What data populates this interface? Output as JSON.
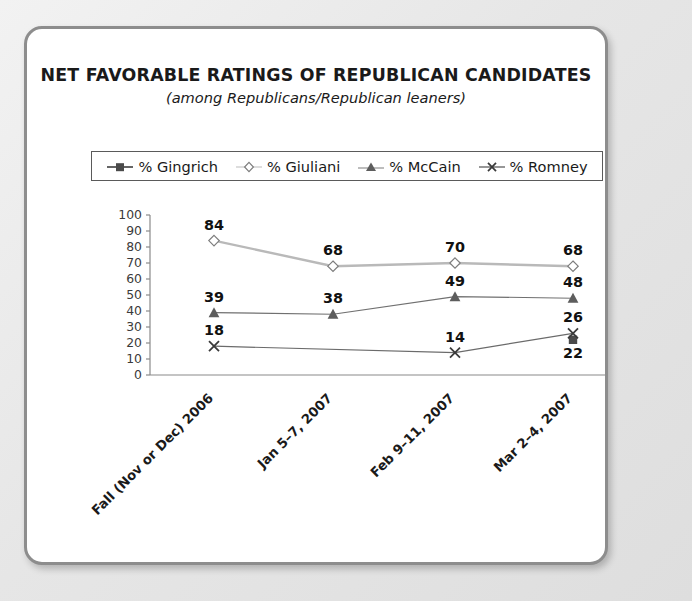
{
  "card": {
    "title": "NET FAVORABLE RATINGS OF REPUBLICAN CANDIDATES",
    "subtitle": "(among Republicans/Republican leaners)"
  },
  "chart_data": {
    "type": "line",
    "title": "NET FAVORABLE RATINGS OF REPUBLICAN CANDIDATES",
    "subtitle": "(among Republicans/Republican leaners)",
    "xlabel": "",
    "ylabel": "",
    "ylim": [
      0,
      100
    ],
    "yticks": [
      0,
      10,
      20,
      30,
      40,
      50,
      60,
      70,
      80,
      90,
      100
    ],
    "grid": false,
    "legend_position": "top",
    "categories": [
      "Fall (Nov or Dec) 2006",
      "Jan 5–7, 2007",
      "Feb 9–11, 2007",
      "Mar 2–4, 2007"
    ],
    "series": [
      {
        "name": "% Gingrich",
        "marker": "square",
        "color": "#4a4a4a",
        "values": [
          null,
          null,
          null,
          22
        ],
        "labels": [
          "",
          "",
          "",
          "22"
        ]
      },
      {
        "name": "% Giuliani",
        "marker": "diamond",
        "color": "#b9b9b9",
        "values": [
          84,
          68,
          70,
          68
        ],
        "labels": [
          "84",
          "68",
          "70",
          "68"
        ]
      },
      {
        "name": "% McCain",
        "marker": "triangle",
        "color": "#707070",
        "values": [
          39,
          38,
          49,
          48
        ],
        "labels": [
          "39",
          "38",
          "49",
          "48"
        ]
      },
      {
        "name": "% Romney",
        "marker": "x",
        "color": "#6b6b6b",
        "values": [
          18,
          null,
          14,
          26
        ],
        "labels": [
          "18",
          "",
          "14",
          "26"
        ]
      }
    ]
  },
  "colors": {
    "card_border": "#8d8d8d",
    "axis": "#8a8a8a",
    "text": "#1a1a1a",
    "page_background": "#e9e9e9"
  }
}
